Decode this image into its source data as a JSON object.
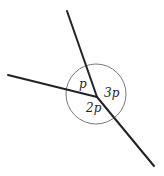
{
  "diagram": {
    "type": "angles-around-point",
    "vertex": {
      "x": 97,
      "y": 97
    },
    "circle": {
      "cx": 96,
      "cy": 94,
      "r": 30,
      "stroke": "#777777"
    },
    "lines": [
      {
        "name": "upper-ray",
        "x1": 67,
        "y1": 11,
        "x2": 97,
        "y2": 97
      },
      {
        "name": "left-ray",
        "x1": 8,
        "y1": 75,
        "x2": 97,
        "y2": 97
      },
      {
        "name": "lower-right-ray",
        "x1": 97,
        "y1": 97,
        "x2": 154,
        "y2": 166
      }
    ],
    "line_color": "#222222",
    "labels": [
      {
        "name": "angle-p-label",
        "text": "p",
        "x": 79,
        "y": 88
      },
      {
        "name": "angle-3p-label",
        "text": "3p",
        "x": 104,
        "y": 97
      },
      {
        "name": "angle-2p-label",
        "text": "2p",
        "x": 86,
        "y": 112
      }
    ]
  }
}
